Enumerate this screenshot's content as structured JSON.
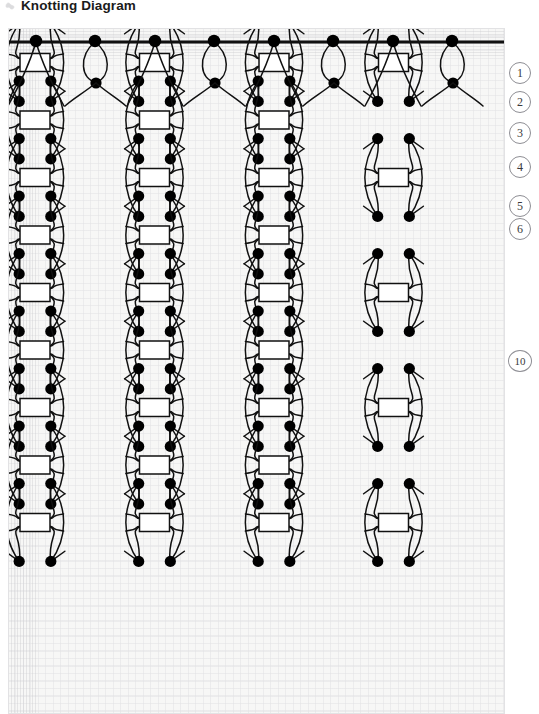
{
  "header": {
    "title": "Knotting Diagram",
    "icon": "knot-icon"
  },
  "steps": [
    {
      "label": "1",
      "top": 62,
      "wide": false
    },
    {
      "label": "2",
      "top": 91,
      "wide": false
    },
    {
      "label": "3",
      "top": 122,
      "wide": false
    },
    {
      "label": "4",
      "top": 156,
      "wide": false
    },
    {
      "label": "5",
      "top": 195,
      "wide": false
    },
    {
      "label": "6",
      "top": 218,
      "wide": false
    },
    {
      "label": "10",
      "top": 350,
      "wide": true
    }
  ],
  "diagram": {
    "type": "knotting-lattice",
    "cord_color": "#111111",
    "knot_fill": "#ffffff",
    "bead_color": "#000000",
    "grid_color": "#cdcdd4",
    "background": "#fbfbfb",
    "mounting_bar": {
      "y": 14,
      "x_start": 0,
      "x_end": 497,
      "thickness": 3.2,
      "anchor_dots_x": [
        28,
        87,
        147,
        206,
        266,
        325,
        385,
        444
      ],
      "loop_dot_indices": [
        1,
        3,
        5,
        7
      ]
    },
    "lattice": {
      "cell_width": 119.5,
      "cell_height": 115,
      "columns": 4,
      "rows": 7,
      "row_offset_x": 59.75,
      "origin_x": 27,
      "origin_y": 92,
      "bead_radius": 5.6,
      "knot_box": {
        "w": 30,
        "h": 18
      }
    }
  }
}
